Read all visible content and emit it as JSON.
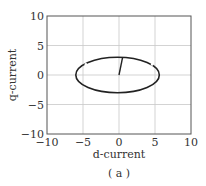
{
  "chart_data": {
    "type": "line",
    "title": "",
    "xlabel": "d-current",
    "ylabel": "q-current",
    "caption": "( a )",
    "xlim": [
      -10,
      10
    ],
    "ylim": [
      -10,
      10
    ],
    "xticks": [
      -10,
      -5,
      0,
      5,
      10
    ],
    "yticks": [
      -10,
      -5,
      0,
      5,
      10
    ],
    "xtick_labels": [
      "−10",
      "−5",
      "0",
      "5",
      "10"
    ],
    "ytick_labels": [
      "−10",
      "−5",
      "0",
      "5",
      "10"
    ],
    "grid": true,
    "legend": null,
    "series": [
      {
        "name": "current trajectory (ellipse)",
        "shape": "ellipse",
        "center": [
          -0.2,
          0.0
        ],
        "semi_axis_d": 5.8,
        "semi_axis_q": 3.0,
        "gaps_near": [
          [
            -4.6,
            1.8
          ],
          [
            4.6,
            1.8
          ]
        ]
      },
      {
        "name": "initial transient",
        "shape": "line",
        "x": [
          0.0,
          0.5
        ],
        "y": [
          0.0,
          3.0
        ]
      }
    ]
  },
  "colors": {
    "curve": "#222222",
    "grid": "#c8c8c8",
    "axes": "#555555",
    "text": "#333333"
  }
}
